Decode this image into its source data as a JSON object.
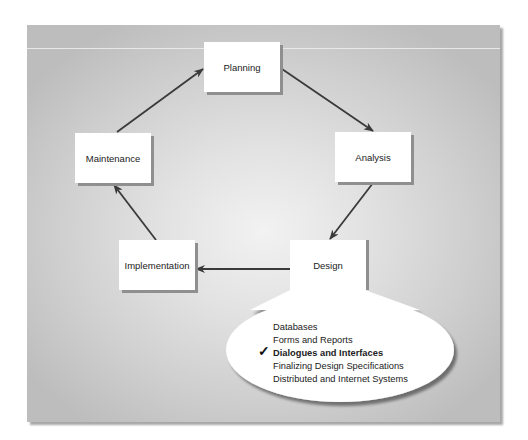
{
  "diagram": {
    "type": "cycle",
    "nodes": [
      {
        "id": "planning",
        "label": "Planning"
      },
      {
        "id": "analysis",
        "label": "Analysis"
      },
      {
        "id": "design",
        "label": "Design"
      },
      {
        "id": "implementation",
        "label": "Implementation"
      },
      {
        "id": "maintenance",
        "label": "Maintenance"
      }
    ],
    "edges": [
      {
        "from": "planning",
        "to": "analysis"
      },
      {
        "from": "analysis",
        "to": "design"
      },
      {
        "from": "design",
        "to": "implementation"
      },
      {
        "from": "implementation",
        "to": "maintenance"
      },
      {
        "from": "maintenance",
        "to": "planning"
      }
    ],
    "callout": {
      "attached_to": "design",
      "items": [
        {
          "label": "Databases",
          "checked": false
        },
        {
          "label": "Forms and Reports",
          "checked": false
        },
        {
          "label": "Dialogues and Interfaces",
          "checked": true
        },
        {
          "label": "Finalizing Design Specifications",
          "checked": false
        },
        {
          "label": "Distributed and Internet Systems",
          "checked": false
        }
      ],
      "check_glyph": "✓"
    }
  },
  "colors": {
    "arrow": "#3a3a3a",
    "box": "#ffffff",
    "box_shadow": "#8f8f8f",
    "panel_edge": "#bdbdbd",
    "panel_center": "#f2f2f2"
  }
}
